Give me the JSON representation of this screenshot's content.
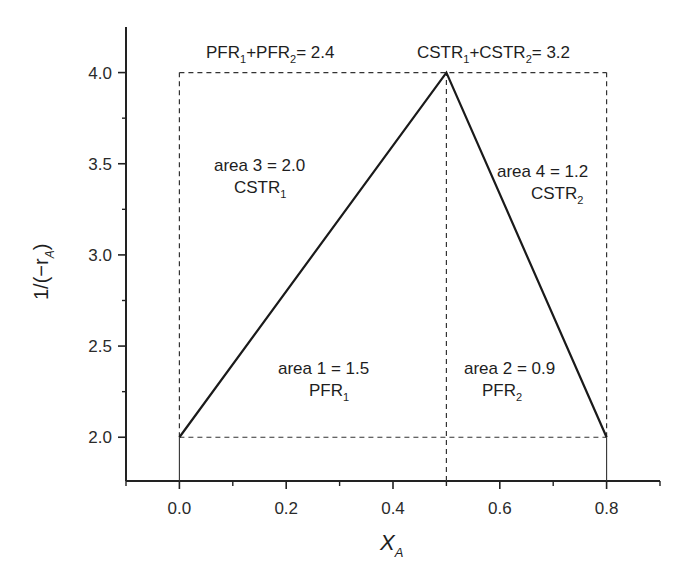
{
  "chart_data": {
    "type": "line",
    "title": "",
    "xlabel": "X_A",
    "xlabel_main": "X",
    "xlabel_sub": "A",
    "ylabel": "1/(−r_A)",
    "ylabel_main": "1/(−r",
    "ylabel_sub": "A",
    "ylabel_close": ")",
    "xlim": [
      -0.1,
      0.9
    ],
    "ylim": [
      1.76,
      4.25
    ],
    "grid": false,
    "legend": null,
    "x_ticks": [
      0.0,
      0.2,
      0.4,
      0.6,
      0.8
    ],
    "x_tick_labels": [
      "0.0",
      "0.2",
      "0.4",
      "0.6",
      "0.8"
    ],
    "x_minor_ticks": [
      -0.1,
      0.1,
      0.3,
      0.5,
      0.7,
      0.9
    ],
    "y_ticks": [
      2.0,
      2.5,
      3.0,
      3.5,
      4.0
    ],
    "y_tick_labels": [
      "2.0",
      "2.5",
      "3.0",
      "3.5",
      "4.0"
    ],
    "y_minor_ticks": [
      2.25,
      2.75,
      3.25,
      3.75
    ],
    "series": [
      {
        "name": "1/(-rA) vs XA",
        "style": "solid",
        "x": [
          0.0,
          0.5,
          0.8
        ],
        "y": [
          2.0,
          4.0,
          2.0
        ]
      }
    ],
    "guides": [
      {
        "name": "top-dashed",
        "style": "dashed",
        "x": [
          0.0,
          0.8
        ],
        "y": [
          4.0,
          4.0
        ]
      },
      {
        "name": "bottom-dashed",
        "style": "dashed",
        "x": [
          0.0,
          0.8
        ],
        "y": [
          2.0,
          2.0
        ]
      },
      {
        "name": "left-dashed",
        "style": "dashed",
        "x": [
          0.0,
          0.0
        ],
        "y": [
          2.0,
          4.0
        ]
      },
      {
        "name": "mid-dashed",
        "style": "dashed",
        "x": [
          0.5,
          0.5
        ],
        "y": [
          1.76,
          4.0
        ]
      },
      {
        "name": "right-dashed",
        "style": "dashed",
        "x": [
          0.8,
          0.8
        ],
        "y": [
          2.0,
          4.0
        ]
      },
      {
        "name": "left-drop",
        "style": "solid-thin",
        "x": [
          0.0,
          0.0
        ],
        "y": [
          1.76,
          2.0
        ]
      },
      {
        "name": "right-drop",
        "style": "solid-thin",
        "x": [
          0.8,
          0.8
        ],
        "y": [
          1.76,
          2.0
        ]
      }
    ],
    "annotations": [
      {
        "id": "pfr_total",
        "text": "PFR1+PFR2= 2.4",
        "parts": [
          "PFR",
          "1",
          "+PFR",
          "2",
          "= 2.4"
        ]
      },
      {
        "id": "cstr_total",
        "text": "CSTR1+CSTR2= 3.2",
        "parts": [
          "CSTR",
          "1",
          "+CSTR",
          "2",
          "= 3.2"
        ]
      },
      {
        "id": "area3",
        "line1": "area 3 = 2.0",
        "line2_main": "CSTR",
        "line2_sub": "1"
      },
      {
        "id": "area4",
        "line1": "area 4 = 1.2",
        "line2_main": "CSTR",
        "line2_sub": "2"
      },
      {
        "id": "area1",
        "line1": "area 1 = 1.5",
        "line2_main": "PFR",
        "line2_sub": "1"
      },
      {
        "id": "area2",
        "line1": "area 2 = 0.9",
        "line2_main": "PFR",
        "line2_sub": "2"
      }
    ]
  }
}
